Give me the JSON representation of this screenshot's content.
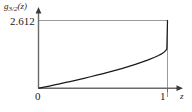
{
  "chart_data": {
    "type": "line",
    "title": "",
    "subtitle": "",
    "xlabel": "z",
    "ylabel": "g3/2(z)",
    "ylabel_base": "g",
    "ylabel_sub": "3/2",
    "ylabel_arg": "(z)",
    "xlim": [
      0,
      1
    ],
    "ylim": [
      0,
      2.612
    ],
    "xticks": [
      "0",
      "1"
    ],
    "xtick_values": [
      0,
      1
    ],
    "yticks": [
      "2.612"
    ],
    "ytick_values": [
      2.612
    ],
    "grid": false,
    "legend": null,
    "series": [
      {
        "name": "g3/2(z)",
        "color": "#1a1a1a",
        "x": [
          0.0,
          0.02,
          0.05,
          0.08,
          0.12,
          0.16,
          0.2,
          0.25,
          0.3,
          0.35,
          0.4,
          0.45,
          0.5,
          0.55,
          0.6,
          0.65,
          0.7,
          0.75,
          0.8,
          0.85,
          0.9,
          0.93,
          0.95,
          0.97,
          0.98,
          0.99,
          0.995,
          1.0
        ],
        "y": [
          0.0,
          0.0202,
          0.0509,
          0.0821,
          0.1245,
          0.1676,
          0.2114,
          0.2673,
          0.3243,
          0.3825,
          0.4421,
          0.5033,
          0.5662,
          0.6312,
          0.6985,
          0.7686,
          0.8421,
          0.9197,
          1.0026,
          1.0926,
          1.1932,
          1.2621,
          1.3139,
          1.3784,
          1.4206,
          1.4762,
          1.5246,
          2.612
        ]
      }
    ],
    "annotations": {
      "value_line_y": 2.612,
      "value_line_color": "#9a9a9a",
      "asymptote_line_x": 1,
      "asymptote_line_color": "#9a9a9a",
      "axis_color": "#6a6a6a"
    }
  },
  "axis_labels": {
    "y_axis_name": "g3/2(z)",
    "x_axis_name": "z",
    "y_max_tick": "2.612",
    "x_zero_tick": "0",
    "x_one_tick": "1"
  },
  "colors": {
    "background": "#ffffff",
    "curve": "#1a1a1a",
    "guide": "#9a9a9a",
    "axis": "#6a6a6a",
    "text": "#1a1a1a"
  }
}
